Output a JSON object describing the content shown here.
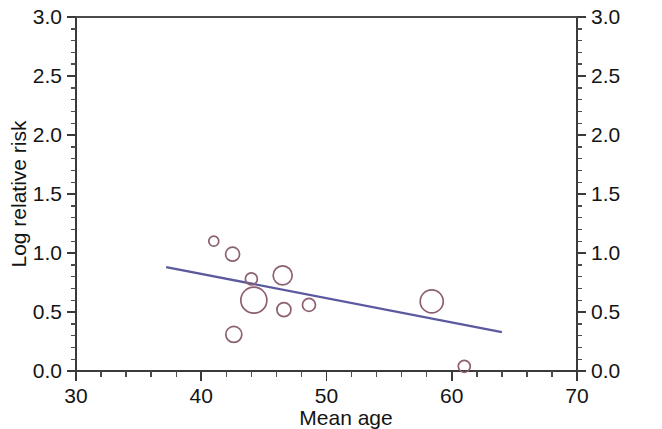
{
  "chart_data": {
    "type": "scatter",
    "title": "",
    "subtitle": "",
    "xlabel": "Mean age",
    "ylabel": "Log relative risk",
    "xlim": [
      30,
      70
    ],
    "ylim": [
      0.0,
      3.0
    ],
    "x_tick_labels": [
      "30",
      "40",
      "50",
      "60",
      "70"
    ],
    "x_ticks": [
      30,
      40,
      50,
      60,
      70
    ],
    "x_minor_tick_step": 2,
    "y_tick_labels": [
      "0.0",
      "0.5",
      "1.0",
      "1.5",
      "2.0",
      "2.5",
      "3.0"
    ],
    "y_ticks": [
      0.0,
      0.5,
      1.0,
      1.5,
      2.0,
      2.5,
      3.0
    ],
    "y_minor_tick_step": 0.1,
    "grid": false,
    "legend": "none",
    "right_axis_mirrored": true,
    "right_axis_tick_labels": [
      "0.0",
      "0.5",
      "1.0",
      "1.5",
      "2.0",
      "2.5",
      "3.0"
    ],
    "marker_style": "open-circle",
    "marker_size_meaning": "study weight",
    "marker_color": "#8c5f73",
    "line_color": "#5b5a9e",
    "axis_color": "#3a3a3a",
    "background_color": "#ffffff",
    "points": [
      {
        "x": 41.0,
        "y": 1.1,
        "r": 5.0
      },
      {
        "x": 42.5,
        "y": 0.99,
        "r": 7.0
      },
      {
        "x": 42.6,
        "y": 0.31,
        "r": 8.0
      },
      {
        "x": 44.0,
        "y": 0.78,
        "r": 6.0
      },
      {
        "x": 44.2,
        "y": 0.6,
        "r": 13.0
      },
      {
        "x": 46.5,
        "y": 0.81,
        "r": 9.5
      },
      {
        "x": 46.6,
        "y": 0.52,
        "r": 7.0
      },
      {
        "x": 48.6,
        "y": 0.56,
        "r": 6.5
      },
      {
        "x": 58.4,
        "y": 0.59,
        "r": 11.5
      },
      {
        "x": 61.0,
        "y": 0.04,
        "r": 6.0
      }
    ],
    "regression_line": {
      "x_start": 37.2,
      "y_start": 0.88,
      "x_end": 64.0,
      "y_end": 0.33,
      "slope": -0.0205,
      "intercept": 1.643
    }
  }
}
